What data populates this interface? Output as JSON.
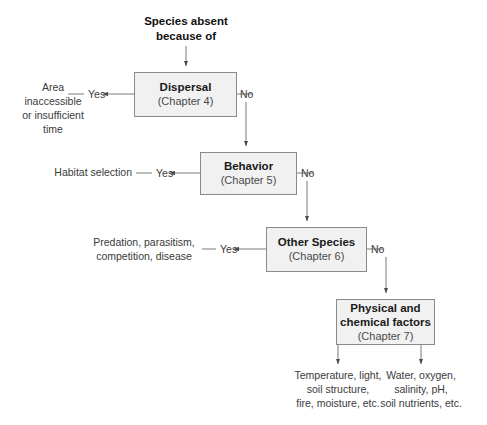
{
  "diagram": {
    "title": "Species absent\nbecause of",
    "nodes": [
      {
        "id": "dispersal",
        "title": "Dispersal",
        "chapter": "(Chapter 4)"
      },
      {
        "id": "behavior",
        "title": "Behavior",
        "chapter": "(Chapter 5)"
      },
      {
        "id": "other",
        "title": "Other Species",
        "chapter": "(Chapter 6)"
      },
      {
        "id": "physical",
        "title": "Physical and\nchemical factors",
        "chapter": "(Chapter 7)"
      }
    ],
    "branch_labels": {
      "yes_dispersal": "Yes",
      "no_dispersal": "No",
      "yes_behavior": "Yes",
      "no_behavior": "No",
      "yes_other": "Yes",
      "no_other": "No"
    },
    "outcomes": [
      {
        "id": "dispersal-outcome",
        "text": "Area\ninaccessible\nor insufficient\ntime"
      },
      {
        "id": "behavior-outcome",
        "text": "Habitat selection"
      },
      {
        "id": "other-outcome",
        "text": "Predation, parasitism,\ncompetition, disease"
      },
      {
        "id": "physical-outcome-left",
        "text": "Temperature, light,\nsoil structure,\nfire, moisture, etc."
      },
      {
        "id": "physical-outcome-right",
        "text": "Water, oxygen,\nsalinity, pH,\nsoil nutrients, etc."
      }
    ],
    "colors": {
      "node_fill": "#f1f1f1",
      "node_border": "#8a8a8a",
      "connector": "#6b6b6b",
      "text": "#3a3a3a"
    }
  }
}
